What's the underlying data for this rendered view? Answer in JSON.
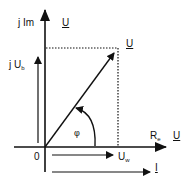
{
  "diagram": {
    "type": "phasor-diagram",
    "colors": {
      "background": "#ffffff",
      "stroke": "#111111"
    },
    "axes": {
      "imaginary": {
        "label": "j Im",
        "label_vector": "U"
      },
      "real": {
        "label": "R",
        "label_sub": "e",
        "label_vector": "U"
      },
      "origin": "0"
    },
    "vectors": {
      "voltage_total": {
        "label": "U",
        "underlined": true
      },
      "voltage_reactive": {
        "label_prefix": "j U",
        "label_sub": "b"
      },
      "voltage_active": {
        "label": "U",
        "label_sub": "w"
      },
      "current": {
        "label": "I",
        "underlined": true
      }
    },
    "angle": {
      "label": "φ"
    },
    "projection_lines": {
      "style": "dotted"
    }
  }
}
